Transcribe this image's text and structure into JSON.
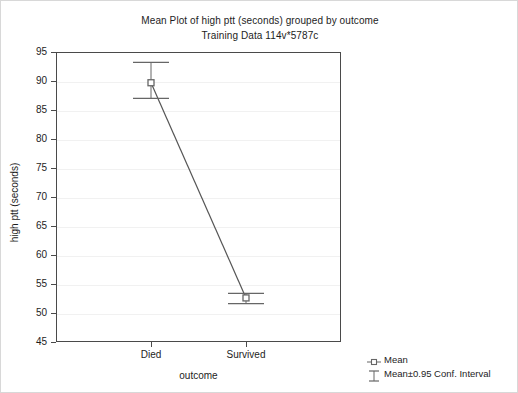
{
  "chart_data": {
    "type": "line",
    "title": "Mean Plot of high ptt (seconds) grouped by outcome",
    "subtitle": "Training Data 114v*5787c",
    "xlabel": "outcome",
    "ylabel": "high ptt (seconds)",
    "categories": [
      "Died",
      "Survived"
    ],
    "values": [
      89.7,
      52.6
    ],
    "error_low": [
      87.0,
      51.6
    ],
    "error_high": [
      93.2,
      53.4
    ],
    "series": [
      {
        "name": "Mean",
        "values": [
          89.7,
          52.6
        ]
      }
    ],
    "ylim": [
      45,
      95
    ],
    "yticks": [
      45,
      50,
      55,
      60,
      65,
      70,
      75,
      80,
      85,
      90,
      95
    ],
    "ytick_labels": [
      "45",
      "50",
      "55",
      "60",
      "65",
      "70",
      "75",
      "80",
      "85",
      "90",
      "95"
    ],
    "grid": true,
    "legend_position": "bottom-right",
    "legend": [
      {
        "label": "Mean",
        "glyph": "square-marker-icon"
      },
      {
        "label": "Mean±0.95 Conf. Interval",
        "glyph": "i-beam-errorbar-icon"
      }
    ],
    "colors": {
      "line": "#555555",
      "marker": "#666666",
      "axis": "#4a4a4a",
      "grid": "#f1f1f1",
      "background": "#ffffff",
      "text": "#1d1d1d"
    }
  }
}
